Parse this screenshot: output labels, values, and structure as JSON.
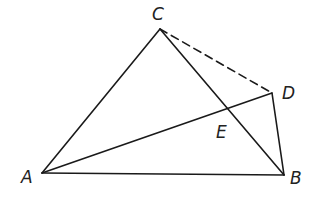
{
  "diagram": {
    "type": "geometry",
    "stroke_color": "#1a1a1a",
    "points": {
      "A": {
        "label": "A",
        "x": 42,
        "y": 173
      },
      "B": {
        "label": "B",
        "x": 284,
        "y": 175
      },
      "C": {
        "label": "C",
        "x": 160,
        "y": 29
      },
      "D": {
        "label": "D",
        "x": 272,
        "y": 93
      },
      "E": {
        "label": "E",
        "x": 228,
        "y": 109
      }
    },
    "segments": [
      {
        "from": "A",
        "to": "C",
        "style": "solid"
      },
      {
        "from": "C",
        "to": "B",
        "style": "solid"
      },
      {
        "from": "A",
        "to": "B",
        "style": "solid"
      },
      {
        "from": "A",
        "to": "D",
        "style": "solid"
      },
      {
        "from": "D",
        "to": "B",
        "style": "solid"
      },
      {
        "from": "C",
        "to": "D",
        "style": "dashed"
      }
    ],
    "intersection": {
      "point": "E",
      "of": [
        "AD",
        "CB"
      ]
    }
  }
}
